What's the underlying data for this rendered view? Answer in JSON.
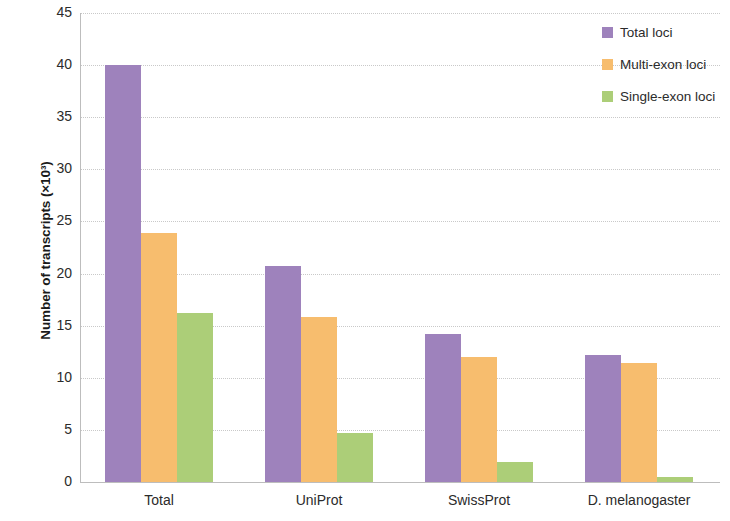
{
  "chart_data": {
    "type": "bar",
    "title": "",
    "subtitle": "",
    "xlabel": "",
    "ylabel": "Number of transcripts (×10³)",
    "categories": [
      "Total",
      "UniProt",
      "SwissProt",
      "D. melanogaster"
    ],
    "series": [
      {
        "name": "Total loci",
        "color": "#9e82bc",
        "values": [
          40.0,
          20.7,
          14.2,
          12.2
        ]
      },
      {
        "name": "Multi-exon loci",
        "color": "#f7bd6e",
        "values": [
          23.9,
          15.8,
          12.0,
          11.4
        ]
      },
      {
        "name": "Single-exon loci",
        "color": "#acce78",
        "values": [
          16.2,
          4.7,
          1.9,
          0.5
        ]
      }
    ],
    "ylim": [
      0,
      45
    ],
    "ytick_step": 5,
    "ytick_labels": [
      "45",
      "40",
      "35",
      "30",
      "25",
      "20",
      "15",
      "10",
      "5",
      "0"
    ],
    "grid": true,
    "grid_axis": "y",
    "legend_position": "top-right",
    "background_color": "#ffffff"
  },
  "legend": {
    "entries": [
      {
        "label": "Total loci"
      },
      {
        "label": "Multi-exon loci"
      },
      {
        "label": "Single-exon loci"
      }
    ]
  }
}
